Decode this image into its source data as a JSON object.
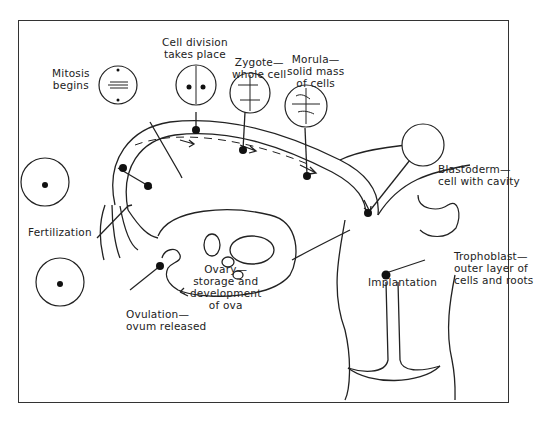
{
  "diagram": {
    "stages": [
      {
        "id": "ovulation",
        "label": "Ovulation—\novum released"
      },
      {
        "id": "ovary",
        "label": "Ovary—\nstorage and\ndevelopment\nof ova"
      },
      {
        "id": "fertilization",
        "label": "Fertilization"
      },
      {
        "id": "mitosis",
        "label": "Mitosis\nbegins"
      },
      {
        "id": "cell_division",
        "label": "Cell division\ntakes place"
      },
      {
        "id": "zygote",
        "label": "Zygote—\nwhole cell"
      },
      {
        "id": "morula",
        "label": "Morula—\nsolid mass\nof cells"
      },
      {
        "id": "blastoderm",
        "label": "Blastoderm—\ncell with cavity"
      },
      {
        "id": "implantation",
        "label": "Implantation"
      },
      {
        "id": "trophoblast",
        "label": "Trophoblast—\nouter layer of\ncells and roots"
      }
    ],
    "colors": {
      "line": "#222222",
      "background": "#ffffff",
      "frame": "#333333"
    }
  }
}
